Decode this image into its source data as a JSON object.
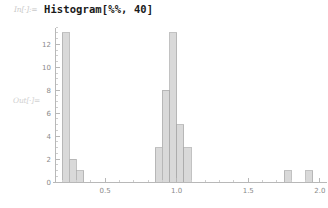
{
  "notebook": {
    "in_label": "In[·]:=",
    "out_label": "Out[·]=",
    "input_code": "Histogram[%%, 40]"
  },
  "chart_data": {
    "type": "bar",
    "title": "",
    "xlabel": "",
    "ylabel": "",
    "xlim": [
      0.15,
      2.05
    ],
    "ylim": [
      0,
      13.6
    ],
    "grid": false,
    "legend": null,
    "bin_width": 0.05,
    "bar_color": "#d9d9d9",
    "bar_edge_color": "#a8a8a8",
    "axis_color": "#b8b8b8",
    "x_ticks": [
      0.5,
      1.0,
      1.5,
      2.0
    ],
    "x_tick_labels": [
      "0.5",
      "1.0",
      "1.5",
      "2.0"
    ],
    "x_minor_step": 0.1,
    "y_ticks": [
      0,
      2,
      4,
      6,
      8,
      10,
      12
    ],
    "y_tick_labels": [
      "0",
      "2",
      "4",
      "6",
      "8",
      "10",
      "12"
    ],
    "y_minor_step": 0.5,
    "bins": [
      {
        "x_left": 0.2,
        "x_right": 0.25,
        "count": 13
      },
      {
        "x_left": 0.25,
        "x_right": 0.3,
        "count": 2
      },
      {
        "x_left": 0.3,
        "x_right": 0.35,
        "count": 1
      },
      {
        "x_left": 0.85,
        "x_right": 0.9,
        "count": 3
      },
      {
        "x_left": 0.9,
        "x_right": 0.95,
        "count": 8
      },
      {
        "x_left": 0.95,
        "x_right": 1.0,
        "count": 13
      },
      {
        "x_left": 1.0,
        "x_right": 1.05,
        "count": 5
      },
      {
        "x_left": 1.05,
        "x_right": 1.1,
        "count": 3
      },
      {
        "x_left": 1.75,
        "x_right": 1.8,
        "count": 1
      },
      {
        "x_left": 1.9,
        "x_right": 1.95,
        "count": 1
      }
    ]
  }
}
